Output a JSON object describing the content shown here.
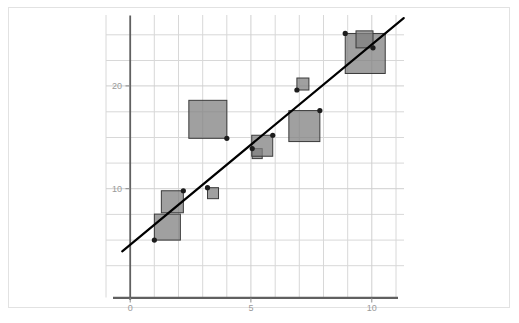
{
  "chart_data": {
    "type": "scatter",
    "title": "",
    "subtitle": "",
    "xlabel": "",
    "ylabel": "",
    "xlim": [
      -0.35,
      11.3
    ],
    "ylim": [
      0.0,
      27.5
    ],
    "grid": true,
    "legend": null,
    "x_ticks": [
      {
        "value": 0,
        "label": "0"
      },
      {
        "value": 5,
        "label": "5"
      },
      {
        "value": 10,
        "label": "10"
      }
    ],
    "y_ticks": [
      {
        "value": 10,
        "label": "10"
      },
      {
        "value": 20,
        "label": "20"
      }
    ],
    "marker_shape": "square",
    "marker_fill": "#808080",
    "marker_stroke": "#3a3a3a",
    "marker_opacity": 0.75,
    "point_color": "#1c1c1c",
    "axis_color": "#555555",
    "grid_color": "#d8d8d8",
    "line_color": "#000000",
    "note": "Bubble scatter: square marker area encodes a third variable; dot marks the (x, y) location.",
    "points": [
      {
        "x": 1.0,
        "y": 5.0,
        "size": 26
      },
      {
        "x": 2.2,
        "y": 9.8,
        "size": 22
      },
      {
        "x": 3.2,
        "y": 10.1,
        "size": 11
      },
      {
        "x": 4.0,
        "y": 14.9,
        "size": 38
      },
      {
        "x": 5.05,
        "y": 13.9,
        "size": 10
      },
      {
        "x": 5.9,
        "y": 15.2,
        "size": 21
      },
      {
        "x": 6.9,
        "y": 19.6,
        "size": 12
      },
      {
        "x": 7.85,
        "y": 17.6,
        "size": 31
      },
      {
        "x": 8.9,
        "y": 25.1,
        "size": 40
      },
      {
        "x": 10.05,
        "y": 23.7,
        "size": 17
      }
    ],
    "trend_line": {
      "type": "linear-fit",
      "x_start": -0.33,
      "y_start": 3.9,
      "x_end": 11.32,
      "y_end": 26.6
    }
  },
  "figure": {
    "frame_label": "chart-frame",
    "background_label": "plot-background"
  }
}
